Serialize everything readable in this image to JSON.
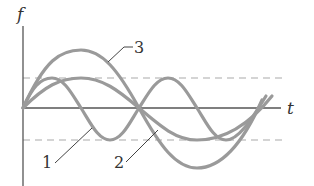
{
  "axes": {
    "y_label": "f",
    "x_label": "t"
  },
  "curves": [
    {
      "id": "1",
      "label": "1",
      "amplitude": "A",
      "relative_period": 1
    },
    {
      "id": "2",
      "label": "2",
      "amplitude": "A",
      "relative_period": 2
    },
    {
      "id": "3",
      "label": "3",
      "amplitude": "2A",
      "relative_period": 2
    }
  ],
  "reference_lines": [
    {
      "name": "upper-amplitude",
      "value": "+A",
      "style": "dashed"
    },
    {
      "name": "lower-amplitude",
      "value": "-A",
      "style": "dashed"
    }
  ],
  "colors": {
    "curve": "#9a9a9a",
    "axis": "#555555",
    "dashed": "#aaaaaa",
    "text": "#333333"
  }
}
